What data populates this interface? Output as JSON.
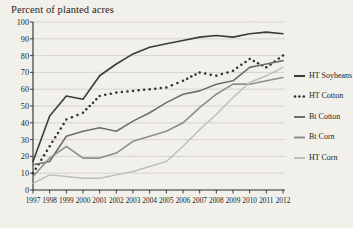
{
  "chart_data": {
    "type": "line",
    "title": "Percent of planted acres",
    "xlabel": "",
    "ylabel": "Percent of planted acres",
    "x": [
      1997,
      1998,
      1999,
      2000,
      2001,
      2002,
      2003,
      2004,
      2005,
      2006,
      2007,
      2008,
      2009,
      2010,
      2011,
      2012
    ],
    "xlim": [
      1997,
      2012
    ],
    "ylim": [
      0,
      100
    ],
    "yticks": [
      0,
      10,
      20,
      30,
      40,
      50,
      60,
      70,
      80,
      90,
      100
    ],
    "xticks": [
      "1997",
      "1998",
      "1999",
      "2000",
      "2001",
      "2002",
      "2003",
      "2004",
      "2005",
      "2006",
      "2007",
      "2008",
      "2009",
      "2010",
      "2011",
      "2012"
    ],
    "grid": true,
    "legend_position": "right",
    "series": [
      {
        "name": "HT Soybeans",
        "style": "solid",
        "color": "#3b3b3b",
        "width": 1.6,
        "values": [
          17,
          44,
          56,
          54,
          68,
          75,
          81,
          85,
          87,
          89,
          91,
          92,
          91,
          93,
          94,
          93
        ]
      },
      {
        "name": "HT Cotton",
        "style": "dotted",
        "color": "#2e2e2e",
        "width": 1.9,
        "values": [
          10,
          26,
          42,
          46,
          56,
          58,
          59,
          60,
          61,
          65,
          70,
          68,
          71,
          78,
          73,
          80
        ]
      },
      {
        "name": "Bt Cotton",
        "style": "solid",
        "color": "#6e6e6e",
        "width": 1.6,
        "values": [
          15,
          17,
          32,
          35,
          37,
          35,
          41,
          46,
          52,
          57,
          59,
          63,
          65,
          73,
          75,
          77
        ]
      },
      {
        "name": "Bt Corn",
        "style": "solid",
        "color": "#8e8e8e",
        "width": 1.6,
        "values": [
          8,
          19,
          26,
          19,
          19,
          22,
          29,
          32,
          35,
          40,
          49,
          57,
          63,
          63,
          65,
          67
        ]
      },
      {
        "name": "HT Corn",
        "style": "solid",
        "color": "#bdbdbd",
        "width": 1.4,
        "values": [
          4,
          9,
          8,
          7,
          7,
          9,
          11,
          14,
          17,
          26,
          36,
          45,
          55,
          64,
          68,
          73
        ]
      }
    ]
  },
  "legend": {
    "items": [
      {
        "label": "HT Soybeans",
        "swatch": "solid",
        "color": "#3b3b3b"
      },
      {
        "label": "HT Cotton",
        "swatch": "dotted",
        "color": "#2e2e2e"
      },
      {
        "label": "Bt Cotton",
        "swatch": "solid",
        "color": "#6e6e6e"
      },
      {
        "label": "Bt Corn",
        "swatch": "solid",
        "color": "#8e8e8e"
      },
      {
        "label": "HT Corn",
        "swatch": "solid",
        "color": "#bdbdbd"
      }
    ]
  }
}
